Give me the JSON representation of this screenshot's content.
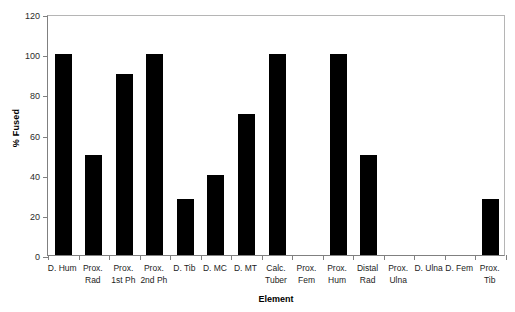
{
  "chart_data": {
    "type": "bar",
    "title": "",
    "xlabel": "Element",
    "ylabel": "% Fused",
    "ylim": [
      0,
      120
    ],
    "ytick_step": 20,
    "yticks": [
      0,
      20,
      40,
      60,
      80,
      100,
      120
    ],
    "ytick_labels": [
      "0",
      "20",
      "40",
      "60",
      "80",
      "100",
      "120"
    ],
    "grid": false,
    "legend": false,
    "bar_color": "#000000",
    "axis_color": "#808080",
    "categories": [
      "D. Hum",
      "Prox.\nRad",
      "Prox.\n1st Ph",
      "Prox.\n2nd Ph",
      "D. Tib",
      "D. MC",
      "D. MT",
      "Calc.\nTuber",
      "Prox.\nFem",
      "Prox.\nHum",
      "Distal\nRad",
      "Prox.\nUlna",
      "D. Ulna",
      "D. Fem",
      "Prox.\nTib"
    ],
    "values": [
      100,
      50,
      90,
      100,
      28,
      40,
      70,
      100,
      0,
      100,
      50,
      0,
      0,
      0,
      28
    ]
  }
}
